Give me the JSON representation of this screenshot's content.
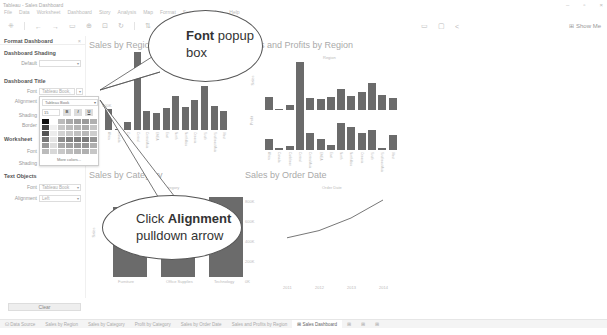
{
  "window": {
    "title": "Tableau - Sales Dashboard",
    "controls": [
      "minimize",
      "restore",
      "close"
    ]
  },
  "menu": [
    "File",
    "Data",
    "Worksheet",
    "Dashboard",
    "Story",
    "Analysis",
    "Map",
    "Format",
    "Server",
    "Window",
    "Help"
  ],
  "toolbar": {
    "icons": [
      "tableau-logo-icon",
      "undo-icon",
      "redo-icon",
      "save-icon",
      "new-datasource-icon",
      "pause-icon",
      "refresh-icon",
      "swap-icon",
      "sort-icon",
      "highlight-icon",
      "label-icon",
      "fit-icon",
      "share-icon"
    ],
    "show_me": "Show Me"
  },
  "format_panel": {
    "header": "Format Dashboard",
    "close": "×",
    "dashboard_shading": {
      "title": "Dashboard Shading",
      "default_label": "Default",
      "default_value": ""
    },
    "dashboard_title": {
      "title": "Dashboard Title",
      "font_label": "Font",
      "font_value": "Tableau Book,",
      "alignment_label": "Alignment",
      "shading_label": "Shading",
      "border_label": "Border"
    },
    "worksheet": {
      "title": "Worksheet",
      "font_label": "Font",
      "shading_label": "Shading"
    },
    "text_objects": {
      "title": "Text Objects",
      "font_label": "Font",
      "font_value": "Tableau Book",
      "alignment_label": "Alignment",
      "alignment_value": "Left"
    },
    "clear_label": "Clear"
  },
  "font_popup": {
    "font_name": "Tableau Book",
    "size": "15",
    "bold": "B",
    "italic": "I",
    "underline": "U",
    "more_colors": "More colors...",
    "swatch_colors": [
      "#111111",
      "#ffffff",
      "#bbbbbb",
      "#a9a9a9",
      "#a0a0a0",
      "#9a9a9a",
      "#b0b0b0",
      "#444444",
      "#f0f0f0",
      "#c8c8c8",
      "#bcbcbc",
      "#b4b4b4",
      "#aaaaaa",
      "#c4c4c4",
      "#555555",
      "#ececec",
      "#d2d2d2",
      "#c8c8c8",
      "#c0c0c0",
      "#b8b8b8",
      "#cecece",
      "#777777",
      "#e4e4e4",
      "#8d8d8d",
      "#828282",
      "#7d7d7d",
      "#7a7a7a",
      "#959595",
      "#999999",
      "#dedede",
      "#aaaaaa",
      "#a0a0a0",
      "#9a9a9a",
      "#959595",
      "#b0b0b0",
      "#bbbbbb",
      "#d8d8d8",
      "#c8c8c8",
      "#bdbdbd",
      "#b5b5b5",
      "#b0b0b0",
      "#c6c6c6"
    ]
  },
  "charts": {
    "sales_by_region": {
      "title": "Sales by Region",
      "y_tick": "100K"
    },
    "sales_profits_region": {
      "title": "Sales and Profits by Region",
      "header": "Region",
      "y1_label": "Sales",
      "y2_label": "Profit"
    },
    "sales_by_category": {
      "title": "Sales by Category",
      "header": "Category",
      "y_label": "Sales",
      "categories": [
        "Furniture",
        "Office Supplies",
        "Technology"
      ]
    },
    "sales_by_order_date": {
      "title": "Sales by Order Date",
      "header": "Order Date",
      "y_ticks": [
        "800K",
        "600K",
        "400K",
        "200K",
        "0K"
      ],
      "x_ticks": [
        "2011",
        "2012",
        "2013",
        "2014"
      ]
    }
  },
  "chart_data": [
    {
      "type": "bar",
      "title": "Sales by Region",
      "categories": [
        "Africa",
        "Canada",
        "Caribbean",
        "Central",
        "Central Asia",
        "EMEA",
        "East",
        "North",
        "North Asia",
        "Oceania",
        "South",
        "Southeast Asia",
        "West"
      ],
      "values": [
        45,
        3,
        18,
        170,
        42,
        38,
        47,
        75,
        50,
        65,
        95,
        52,
        42
      ],
      "ylabel": "Sales (K)"
    },
    {
      "type": "bar",
      "title": "Sales and Profits by Region",
      "categories": [
        "Africa",
        "Canada",
        "Caribbean",
        "Central",
        "Central Asia",
        "EMEA",
        "East",
        "North",
        "North Asia",
        "Oceania",
        "South",
        "Southeast Asia",
        "West"
      ],
      "series": [
        {
          "name": "Sales",
          "values": [
            45,
            3,
            18,
            170,
            42,
            38,
            47,
            75,
            50,
            65,
            95,
            52,
            42
          ]
        },
        {
          "name": "Profit",
          "values": [
            25,
            5,
            8,
            90,
            38,
            24,
            12,
            60,
            52,
            38,
            44,
            5,
            34
          ]
        }
      ]
    },
    {
      "type": "bar",
      "title": "Sales by Category",
      "categories": [
        "Furniture",
        "Office Supplies",
        "Technology"
      ],
      "values": [
        740,
        720,
        840
      ],
      "ylabel": "Sales (K)"
    },
    {
      "type": "line",
      "title": "Sales by Order Date",
      "x": [
        "2011",
        "2012",
        "2013",
        "2014"
      ],
      "values": [
        480,
        560,
        700,
        900
      ],
      "ylabel": "Sales"
    }
  ],
  "callouts": {
    "font_popup": {
      "bold": "Font",
      "rest": " popup box"
    },
    "alignment": {
      "pre": "Click ",
      "bold": "Alignment",
      "rest": " pulldown arrow"
    }
  },
  "tabs": [
    "Data Source",
    "Sales by Region",
    "Sales by Category",
    "Profit by Category",
    "Sales by Order Date",
    "Sales and Profits by Region",
    "Sales Dashboard"
  ],
  "active_tab": "Sales Dashboard"
}
